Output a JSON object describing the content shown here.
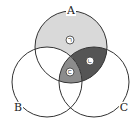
{
  "diagram": {
    "type": "venn",
    "sets": [
      {
        "id": "A",
        "label": "A",
        "cx": 71,
        "cy": 47,
        "r": 36
      },
      {
        "id": "B",
        "label": "B",
        "cx": 47,
        "cy": 82,
        "r": 35
      },
      {
        "id": "C",
        "label": "C",
        "cx": 94,
        "cy": 82,
        "r": 35
      }
    ],
    "regions": [
      {
        "name": "A only",
        "marker": "ㄱ",
        "shade": "light",
        "color": "#d9d9d9"
      },
      {
        "name": "A∩C only",
        "marker": "ㄴ",
        "shade": "dark",
        "color": "#555555"
      },
      {
        "name": "A∩B∩C",
        "marker": "ㄷ",
        "shade": "medium",
        "color": "#8c8c8c"
      },
      {
        "name": "A∩B only",
        "marker": "",
        "shade": "none",
        "color": "#ffffff"
      }
    ],
    "markers": {
      "a": "ㄱ",
      "b": "ㄴ",
      "c": "ㄷ"
    },
    "labels": {
      "A": "A",
      "B": "B",
      "C": "C"
    },
    "stroke_color": "#333333"
  }
}
